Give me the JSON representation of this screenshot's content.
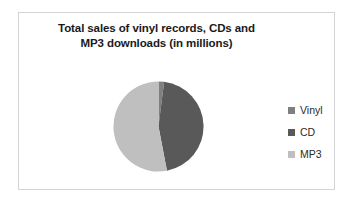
{
  "chart_data": {
    "type": "pie",
    "title": "Total sales of vinyl records, CDs and MP3 downloads (in millions)",
    "title_lines": [
      "Total sales of vinyl records, CDs and",
      "MP3 downloads (in millions)"
    ],
    "categories": [
      "Vinyl",
      "CD",
      "MP3"
    ],
    "values": [
      2,
      45,
      53
    ],
    "units": "millions",
    "colors": [
      "#7f7f7f",
      "#595959",
      "#bfbfbf"
    ],
    "legend_position": "right",
    "grid": false,
    "data_labels": false,
    "start_angle_deg": 0,
    "slices": [
      {
        "label": "Vinyl",
        "value": 2,
        "color": "#7f7f7f"
      },
      {
        "label": "CD",
        "value": 45,
        "color": "#595959"
      },
      {
        "label": "MP3",
        "value": 53,
        "color": "#bfbfbf"
      }
    ]
  },
  "chart": {
    "title_line1": "Total sales of vinyl records, CDs and",
    "title_line2": "MP3 downloads (in millions)"
  },
  "legend": {
    "items": [
      {
        "label": "Vinyl",
        "color": "#7f7f7f"
      },
      {
        "label": "CD",
        "color": "#595959"
      },
      {
        "label": "MP3",
        "color": "#bfbfbf"
      }
    ]
  },
  "style": {
    "background": "#ffffff",
    "border_color": "#d4d4d4",
    "title_color": "#1a1a1a",
    "legend_text_color": "#2b2b2b"
  }
}
